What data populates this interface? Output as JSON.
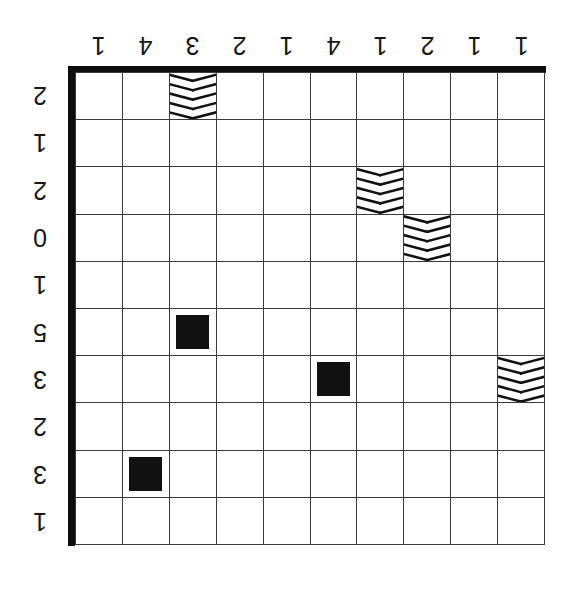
{
  "puzzle": {
    "title": "Grid Puzzle",
    "rows": 10,
    "columns": 10,
    "colors": {
      "ink": "#111111",
      "gridline": "#3b3b3b",
      "frame": "#0d0d0d",
      "background": "#ffffff"
    },
    "label_orientation": "rotated-180",
    "top_clues": [
      "1",
      "4",
      "3",
      "2",
      "1",
      "4",
      "1",
      "2",
      "1",
      "1"
    ],
    "left_clues": [
      "2",
      "1",
      "2",
      "0",
      "1",
      "5",
      "3",
      "2",
      "3",
      "1"
    ],
    "marker_types": {
      "ship": "solid-black-square",
      "chevron": "chevron-striped-cell"
    },
    "markers": [
      {
        "row": 1,
        "col": 3,
        "type": "chevron"
      },
      {
        "row": 3,
        "col": 7,
        "type": "chevron"
      },
      {
        "row": 4,
        "col": 8,
        "type": "chevron"
      },
      {
        "row": 6,
        "col": 3,
        "type": "ship"
      },
      {
        "row": 7,
        "col": 6,
        "type": "ship"
      },
      {
        "row": 7,
        "col": 10,
        "type": "chevron"
      },
      {
        "row": 9,
        "col": 2,
        "type": "ship"
      }
    ]
  }
}
